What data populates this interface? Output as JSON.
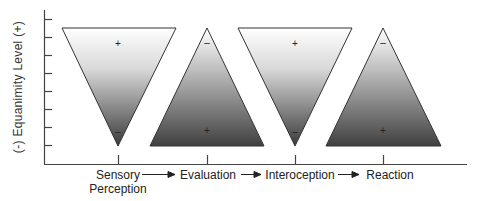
{
  "diagram": {
    "y_axis_label": "(-)  Equanimity Level  (+)",
    "stages": [
      {
        "label": "Sensory\nPerception",
        "line1": "Sensory",
        "line2": "Perception",
        "shape": "inverted-triangle",
        "top_sign": "+",
        "bottom_sign": "–"
      },
      {
        "label": "Evaluation",
        "shape": "upright-triangle",
        "top_sign": "–",
        "bottom_sign": "+"
      },
      {
        "label": "Interoception",
        "shape": "inverted-triangle",
        "top_sign": "+",
        "bottom_sign": "–"
      },
      {
        "label": "Reaction",
        "shape": "upright-triangle",
        "top_sign": "–",
        "bottom_sign": "+"
      }
    ],
    "colors": {
      "light": "#ffffff",
      "dark": "#3a3a3a",
      "line": "#333333"
    }
  }
}
